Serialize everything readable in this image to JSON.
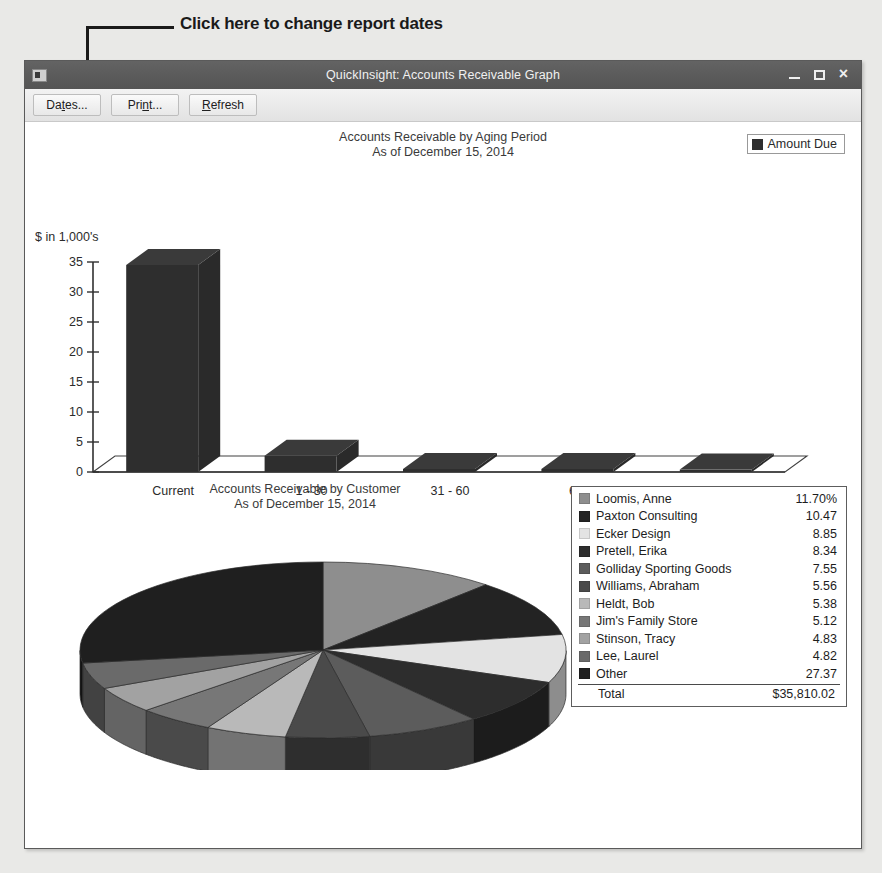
{
  "callout": {
    "text": "Click here to change report dates"
  },
  "window": {
    "title": "QuickInsight: Accounts Receivable Graph",
    "icon": "application-icon",
    "controls": {
      "minimize": "minimize-icon",
      "maximize": "maximize-icon",
      "close": "×"
    }
  },
  "toolbar": {
    "buttons": [
      {
        "pre": "Da",
        "mnemonic": "t",
        "post": "es..."
      },
      {
        "pre": "Pri",
        "mnemonic": "n",
        "post": "t..."
      },
      {
        "pre": "",
        "mnemonic": "R",
        "post": "efresh"
      }
    ]
  },
  "chart_data": [
    {
      "type": "bar",
      "title": "Accounts Receivable by Aging Period",
      "subtitle": "As of December 15, 2014",
      "xlabel": "",
      "ylabel": "$ in 1,000's",
      "categories": [
        "Current",
        "1 - 30",
        "31 - 60",
        "61 - 90",
        "> 90"
      ],
      "values": [
        34.5,
        2.7,
        0.5,
        0.5,
        0.4
      ],
      "yticks": [
        0,
        5,
        10,
        15,
        20,
        25,
        30,
        35
      ],
      "ylim": [
        0,
        35
      ],
      "grid": false,
      "legend": {
        "position": "top-right",
        "entries": [
          "Amount Due"
        ]
      },
      "series_color": "#2e2e2e"
    },
    {
      "type": "pie",
      "title": "Accounts Receivable by Customer",
      "subtitle": "As of December 15, 2014",
      "legend_position": "right",
      "value_suffix": "%",
      "slices": [
        {
          "label": "Loomis, Anne",
          "value": "11.70%",
          "pct": 11.7,
          "color": "#8e8e8e"
        },
        {
          "label": "Paxton Consulting",
          "value": "10.47",
          "pct": 10.47,
          "color": "#232323"
        },
        {
          "label": "Ecker Design",
          "value": "8.85",
          "pct": 8.85,
          "color": "#e3e3e3"
        },
        {
          "label": "Pretell, Erika",
          "value": "8.34",
          "pct": 8.34,
          "color": "#2d2d2d"
        },
        {
          "label": "Golliday Sporting Goods",
          "value": "7.55",
          "pct": 7.55,
          "color": "#5c5c5c"
        },
        {
          "label": "Williams, Abraham",
          "value": "5.56",
          "pct": 5.56,
          "color": "#4a4a4a"
        },
        {
          "label": "Heldt, Bob",
          "value": "5.38",
          "pct": 5.38,
          "color": "#b9b9b9"
        },
        {
          "label": "Jim's Family Store",
          "value": "5.12",
          "pct": 5.12,
          "color": "#777777"
        },
        {
          "label": "Stinson, Tracy",
          "value": "4.83",
          "pct": 4.83,
          "color": "#a2a2a2"
        },
        {
          "label": "Lee, Laurel",
          "value": "4.82",
          "pct": 4.82,
          "color": "#6a6a6a"
        },
        {
          "label": "Other",
          "value": "27.37",
          "pct": 27.37,
          "color": "#1f1f1f"
        }
      ],
      "total_label": "Total",
      "total_value": "$35,810.02"
    }
  ]
}
